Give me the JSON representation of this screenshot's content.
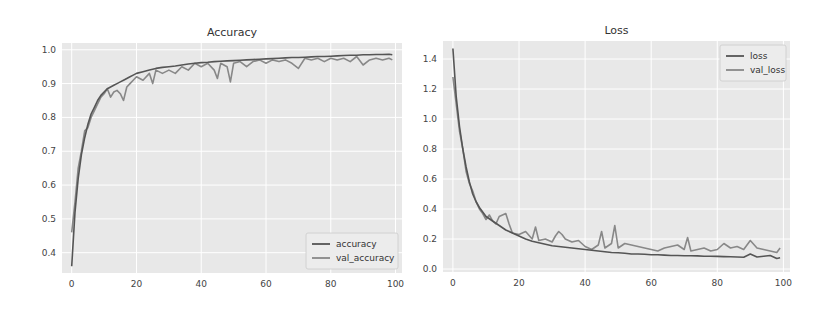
{
  "chart_data": [
    {
      "type": "line",
      "title": "Accuracy",
      "xlabel": "",
      "ylabel": "",
      "xlim": [
        -3,
        102
      ],
      "ylim": [
        0.34,
        1.02
      ],
      "xticks": [
        0,
        20,
        40,
        60,
        80,
        100
      ],
      "yticks": [
        0.4,
        0.5,
        0.6,
        0.7,
        0.8,
        0.9,
        1.0
      ],
      "xtick_labels": [
        "0",
        "20",
        "40",
        "60",
        "80",
        "100"
      ],
      "ytick_labels": [
        "0.4",
        "0.5",
        "0.6",
        "0.7",
        "0.8",
        "0.9",
        "1.0"
      ],
      "grid": true,
      "legend_position": "lower right",
      "series": [
        {
          "name": "accuracy",
          "color": "#555555",
          "x": [
            0,
            1,
            2,
            3,
            4,
            5,
            6,
            7,
            8,
            9,
            10,
            11,
            12,
            13,
            14,
            15,
            16,
            17,
            18,
            19,
            20,
            22,
            24,
            26,
            28,
            30,
            32,
            34,
            36,
            38,
            40,
            42,
            44,
            46,
            48,
            50,
            52,
            54,
            56,
            58,
            60,
            62,
            64,
            66,
            68,
            70,
            72,
            74,
            76,
            78,
            80,
            82,
            84,
            86,
            88,
            90,
            92,
            94,
            96,
            98,
            99
          ],
          "values": [
            0.36,
            0.52,
            0.62,
            0.69,
            0.74,
            0.78,
            0.81,
            0.83,
            0.85,
            0.865,
            0.875,
            0.885,
            0.89,
            0.895,
            0.9,
            0.905,
            0.91,
            0.915,
            0.92,
            0.925,
            0.93,
            0.935,
            0.94,
            0.945,
            0.948,
            0.95,
            0.952,
            0.955,
            0.958,
            0.96,
            0.962,
            0.963,
            0.965,
            0.966,
            0.967,
            0.968,
            0.969,
            0.97,
            0.971,
            0.972,
            0.973,
            0.974,
            0.975,
            0.976,
            0.977,
            0.977,
            0.978,
            0.979,
            0.98,
            0.98,
            0.981,
            0.982,
            0.983,
            0.984,
            0.984,
            0.985,
            0.985,
            0.986,
            0.986,
            0.987,
            0.985
          ]
        },
        {
          "name": "val_accuracy",
          "color": "#888888",
          "x": [
            0,
            1,
            2,
            3,
            4,
            5,
            6,
            7,
            8,
            9,
            10,
            11,
            12,
            13,
            14,
            15,
            16,
            17,
            18,
            19,
            20,
            22,
            24,
            25,
            26,
            28,
            30,
            32,
            34,
            36,
            38,
            40,
            42,
            44,
            45,
            46,
            48,
            49,
            50,
            52,
            54,
            56,
            58,
            60,
            62,
            64,
            66,
            68,
            70,
            72,
            74,
            76,
            78,
            80,
            82,
            84,
            86,
            88,
            90,
            92,
            94,
            96,
            98,
            99
          ],
          "values": [
            0.46,
            0.55,
            0.65,
            0.7,
            0.76,
            0.77,
            0.8,
            0.82,
            0.84,
            0.86,
            0.87,
            0.885,
            0.86,
            0.875,
            0.88,
            0.87,
            0.85,
            0.89,
            0.9,
            0.91,
            0.92,
            0.91,
            0.93,
            0.9,
            0.94,
            0.93,
            0.94,
            0.93,
            0.95,
            0.94,
            0.96,
            0.95,
            0.96,
            0.94,
            0.915,
            0.96,
            0.95,
            0.905,
            0.96,
            0.965,
            0.95,
            0.965,
            0.97,
            0.96,
            0.97,
            0.965,
            0.97,
            0.96,
            0.945,
            0.975,
            0.97,
            0.975,
            0.965,
            0.975,
            0.97,
            0.975,
            0.965,
            0.98,
            0.955,
            0.97,
            0.975,
            0.97,
            0.975,
            0.97
          ]
        }
      ]
    },
    {
      "type": "line",
      "title": "Loss",
      "xlabel": "",
      "ylabel": "",
      "xlim": [
        -3,
        102
      ],
      "ylim": [
        -0.02,
        1.52
      ],
      "xticks": [
        0,
        20,
        40,
        60,
        80,
        100
      ],
      "yticks": [
        0.0,
        0.2,
        0.4,
        0.6,
        0.8,
        1.0,
        1.2,
        1.4
      ],
      "xtick_labels": [
        "0",
        "20",
        "40",
        "60",
        "80",
        "100"
      ],
      "ytick_labels": [
        "0.0",
        "0.2",
        "0.4",
        "0.6",
        "0.8",
        "1.0",
        "1.2",
        "1.4"
      ],
      "grid": true,
      "legend_position": "upper right",
      "series": [
        {
          "name": "loss",
          "color": "#555555",
          "x": [
            0,
            1,
            2,
            3,
            4,
            5,
            6,
            7,
            8,
            9,
            10,
            12,
            14,
            16,
            18,
            20,
            22,
            24,
            26,
            28,
            30,
            32,
            34,
            36,
            38,
            40,
            42,
            44,
            46,
            48,
            50,
            52,
            54,
            56,
            58,
            60,
            62,
            64,
            66,
            68,
            70,
            72,
            74,
            76,
            78,
            80,
            82,
            84,
            86,
            88,
            90,
            92,
            94,
            96,
            98,
            99
          ],
          "values": [
            1.47,
            1.15,
            0.95,
            0.8,
            0.68,
            0.58,
            0.5,
            0.45,
            0.41,
            0.38,
            0.35,
            0.32,
            0.29,
            0.26,
            0.24,
            0.22,
            0.2,
            0.185,
            0.175,
            0.165,
            0.155,
            0.15,
            0.145,
            0.14,
            0.135,
            0.13,
            0.125,
            0.12,
            0.115,
            0.11,
            0.108,
            0.105,
            0.1,
            0.1,
            0.098,
            0.095,
            0.095,
            0.093,
            0.09,
            0.09,
            0.088,
            0.088,
            0.087,
            0.085,
            0.085,
            0.084,
            0.083,
            0.082,
            0.08,
            0.078,
            0.1,
            0.08,
            0.085,
            0.09,
            0.07,
            0.075
          ]
        },
        {
          "name": "val_loss",
          "color": "#888888",
          "x": [
            0,
            1,
            2,
            3,
            4,
            5,
            6,
            7,
            8,
            9,
            10,
            11,
            12,
            13,
            14,
            15,
            16,
            17,
            18,
            20,
            22,
            24,
            25,
            26,
            28,
            30,
            31,
            32,
            33,
            34,
            36,
            38,
            40,
            42,
            44,
            45,
            46,
            48,
            49,
            50,
            52,
            54,
            56,
            58,
            60,
            62,
            64,
            66,
            68,
            70,
            71,
            72,
            74,
            76,
            78,
            80,
            82,
            84,
            86,
            88,
            90,
            92,
            94,
            96,
            98,
            99
          ],
          "values": [
            1.28,
            1.1,
            0.92,
            0.8,
            0.65,
            0.57,
            0.52,
            0.45,
            0.4,
            0.37,
            0.33,
            0.36,
            0.32,
            0.3,
            0.35,
            0.36,
            0.37,
            0.3,
            0.24,
            0.23,
            0.25,
            0.2,
            0.28,
            0.19,
            0.2,
            0.18,
            0.22,
            0.25,
            0.23,
            0.2,
            0.18,
            0.19,
            0.15,
            0.13,
            0.16,
            0.25,
            0.14,
            0.17,
            0.29,
            0.14,
            0.17,
            0.16,
            0.15,
            0.14,
            0.13,
            0.12,
            0.14,
            0.15,
            0.16,
            0.13,
            0.21,
            0.12,
            0.13,
            0.14,
            0.12,
            0.13,
            0.17,
            0.14,
            0.15,
            0.13,
            0.19,
            0.14,
            0.13,
            0.12,
            0.11,
            0.14
          ]
        }
      ]
    }
  ],
  "charts": {
    "accuracy": {
      "title": "Accuracy",
      "legend": [
        "accuracy",
        "val_accuracy"
      ]
    },
    "loss": {
      "title": "Loss",
      "legend": [
        "loss",
        "val_loss"
      ]
    }
  }
}
